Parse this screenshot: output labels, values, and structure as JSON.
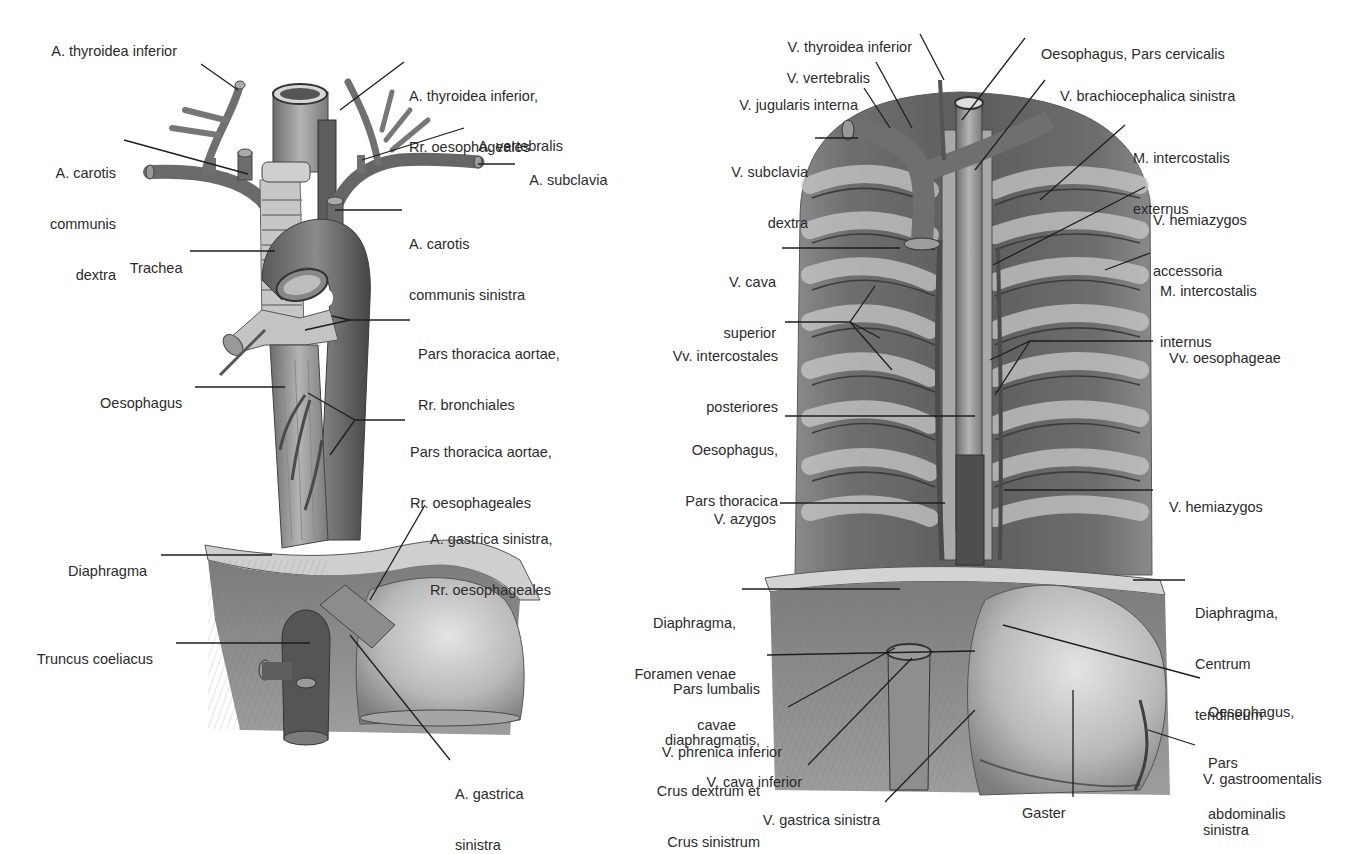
{
  "figure": {
    "left_panel": {
      "title": "Arterial supply of the oesophagus",
      "labels": {
        "a_thyroidea_inferior": "A. thyroidea inferior",
        "a_thyroidea_inferior_rr_1": "A. thyroidea inferior,",
        "a_thyroidea_inferior_rr_2": "Rr. oesophageales",
        "a_carotis_dextra_1": "A. carotis",
        "a_carotis_dextra_2": "communis",
        "a_carotis_dextra_3": "dextra",
        "a_vertebralis": "A. vertebralis",
        "a_subclavia": "A. subclavia",
        "a_carotis_sinistra_1": "A. carotis",
        "a_carotis_sinistra_2": "communis sinistra",
        "trachea": "Trachea",
        "pars_thoracica_bronchiales_1": "Pars thoracica aortae,",
        "pars_thoracica_bronchiales_2": "Rr. bronchiales",
        "oesophagus": "Oesophagus",
        "pars_thoracica_oesophageales_1": "Pars thoracica aortae,",
        "pars_thoracica_oesophageales_2": "Rr. oesophageales",
        "a_gastrica_sinistra_rr_1": "A. gastrica sinistra,",
        "a_gastrica_sinistra_rr_2": "Rr. oesophageales",
        "diaphragma": "Diaphragma",
        "truncus_coeliacus": "Truncus coeliacus",
        "a_gastrica_sinistra_1": "A. gastrica",
        "a_gastrica_sinistra_2": "sinistra"
      }
    },
    "right_panel": {
      "title": "Venous drainage of the oesophagus",
      "labels": {
        "v_thyroidea_inferior": "V. thyroidea inferior",
        "v_vertebralis": "V. vertebralis",
        "v_jugularis_interna": "V. jugularis interna",
        "v_subclavia_dextra_1": "V. subclavia",
        "v_subclavia_dextra_2": "dextra",
        "v_cava_superior_1": "V. cava",
        "v_cava_superior_2": "superior",
        "vv_intercostales_1": "Vv. intercostales",
        "vv_intercostales_2": "posteriores",
        "oesophagus_thoracica_1": "Oesophagus,",
        "oesophagus_thoracica_2": "Pars thoracica",
        "v_azygos": "V. azygos",
        "diaphragma_foramen_1": "Diaphragma,",
        "diaphragma_foramen_2": "Foramen venae",
        "diaphragma_foramen_3": "cavae",
        "pars_lumbalis_1": "Pars lumbalis",
        "pars_lumbalis_2": "diaphragmatis,",
        "pars_lumbalis_3": "Crus dextrum et",
        "pars_lumbalis_4": "Crus sinistrum",
        "v_phrenica_inferior": "V. phrenica inferior",
        "v_cava_inferior": "V. cava inferior",
        "v_gastrica_sinistra": "V. gastrica sinistra",
        "oesophagus_cervicalis": "Oesophagus, Pars cervicalis",
        "v_brachiocephalica_sinistra": "V. brachiocephalica sinistra",
        "m_intercostalis_externus_1": "M. intercostalis",
        "m_intercostalis_externus_2": "externus",
        "v_hemiazygos_accessoria_1": "V. hemiazygos",
        "v_hemiazygos_accessoria_2": "accessoria",
        "m_intercostalis_internus_1": "M. intercostalis",
        "m_intercostalis_internus_2": "internus",
        "vv_oesophageae": "Vv. oesophageae",
        "v_hemiazygos": "V. hemiazygos",
        "diaphragma_centrum_1": "Diaphragma,",
        "diaphragma_centrum_2": "Centrum",
        "diaphragma_centrum_3": "tendineum",
        "oesophagus_abdominalis_1": "Oesophagus,",
        "oesophagus_abdominalis_2": "Pars",
        "oesophagus_abdominalis_3": "abdominalis",
        "v_gastroomentalis_1": "V. gastroomentalis",
        "v_gastroomentalis_2": "sinistra",
        "gaster": "Gaster"
      }
    },
    "colors": {
      "background": "#ffffff",
      "text": "#2b2b2b",
      "leader_line": "#1e1e1e"
    }
  }
}
